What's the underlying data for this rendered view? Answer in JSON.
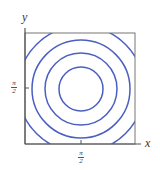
{
  "figure": {
    "type": "contour-plot",
    "x_axis_label": "x",
    "y_axis_label": "y",
    "x_tick": {
      "numerator": "π",
      "denominator": "2"
    },
    "y_tick": {
      "numerator": "π",
      "denominator": "2"
    },
    "contour_color": "#4a5fc1",
    "axis_color": "#555555",
    "contours": [
      {
        "level": 1,
        "radius": 22
      },
      {
        "level": 2,
        "radius": 36
      },
      {
        "level": 3,
        "radius": 49
      },
      {
        "level": 4,
        "radius": 63
      }
    ]
  }
}
